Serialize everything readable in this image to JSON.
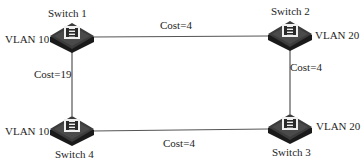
{
  "switches": [
    {
      "name": "Switch 1",
      "vlan": "VLAN 10"
    },
    {
      "name": "Switch 2",
      "vlan": "VLAN 20"
    },
    {
      "name": "Switch 3",
      "vlan": "VLAN 20"
    },
    {
      "name": "Switch 4",
      "vlan": "VLAN 10"
    }
  ],
  "links": [
    {
      "from": "Switch 1",
      "to": "Switch 2",
      "cost": "Cost=4"
    },
    {
      "from": "Switch 2",
      "to": "Switch 3",
      "cost": "Cost=4"
    },
    {
      "from": "Switch 4",
      "to": "Switch 3",
      "cost": "Cost=4"
    },
    {
      "from": "Switch 1",
      "to": "Switch 4",
      "cost": "Cost=19"
    }
  ],
  "colors": {
    "line": "#555555",
    "switch_top": "#3a3a3a",
    "switch_side": "#1a1a1a",
    "switch_face": "#e8e8e8"
  }
}
